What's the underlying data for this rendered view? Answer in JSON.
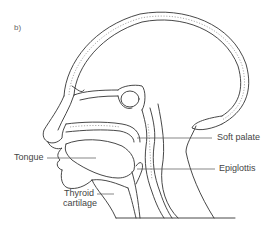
{
  "figure": {
    "panel_label": "b)",
    "labels": {
      "soft_palate": "Soft palate",
      "tongue": "Tongue",
      "epiglottis": "Epiglottis",
      "thyroid_line1": "Thyroid",
      "thyroid_line2": "cartilage"
    },
    "colors": {
      "line": "#333333",
      "background": "#ffffff"
    }
  }
}
